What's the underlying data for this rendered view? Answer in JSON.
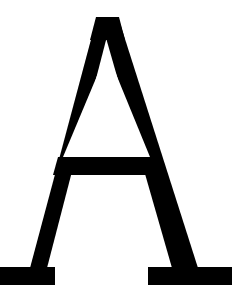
{
  "image": {
    "kind": "glyph-render",
    "width": 244,
    "height": 305,
    "background_color": "#FFFFFF",
    "alt_text": "Capital letter A"
  },
  "glyph": {
    "character": "A",
    "name": "latin-capital-letter-a",
    "style": "serif",
    "weight": "regular",
    "color": "#000000",
    "cap_height_px": 268,
    "apex_top_y": 17,
    "baseline_y": 285,
    "crossbar_top_y": 157,
    "crossbar_bottom_y": 175,
    "left_foot_x_start": 0,
    "left_foot_x_end": 55,
    "right_foot_x_start": 148,
    "right_foot_x_end": 232,
    "left_stroke_is_thin": true,
    "right_stroke_is_thick": true,
    "clipped_at_left_edge": true,
    "outline_points": "96,17 118,17 186,267 232,267 232,285 148,285 148,267 170,267 150,195 56,195 38,267 55,267 55,285 0,285 0,267 18,267 96,17",
    "counter_points": "107,55 62,175 148,175 107,55"
  }
}
